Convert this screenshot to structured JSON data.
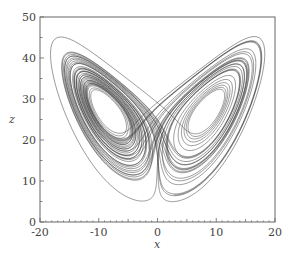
{
  "chart_data": {
    "type": "line",
    "title": "",
    "xlabel": "x",
    "ylabel": "z",
    "xlim": [
      -20,
      20
    ],
    "ylim": [
      0,
      50
    ],
    "x_ticks": [
      -20,
      -10,
      0,
      10,
      20
    ],
    "x_tick_labels": [
      "-20",
      "-10",
      "0",
      "10",
      "20"
    ],
    "y_ticks": [
      0,
      10,
      20,
      30,
      40,
      50
    ],
    "y_tick_labels": [
      "0",
      "10",
      "20",
      "30",
      "40",
      "50"
    ],
    "grid": false,
    "legend": null,
    "series": [
      {
        "name": "trajectory",
        "system": "lorenz",
        "params": {
          "sigma": 10,
          "rho": 28,
          "beta": 2.6667
        },
        "initial": [
          1,
          1,
          20
        ],
        "dt": 0.005,
        "steps": 9000,
        "transient_steps": 400,
        "color": "#3a3a3a"
      }
    ],
    "approx_extent": {
      "x_min": -18,
      "x_max": 19,
      "z_min": 5,
      "z_max": 46
    },
    "lobe_centers": [
      [
        -8.5,
        27
      ],
      [
        8.5,
        27
      ]
    ]
  },
  "style": {
    "line_color": "#3a3a3a",
    "frame_color": "#666666",
    "background": "#ffffff"
  }
}
